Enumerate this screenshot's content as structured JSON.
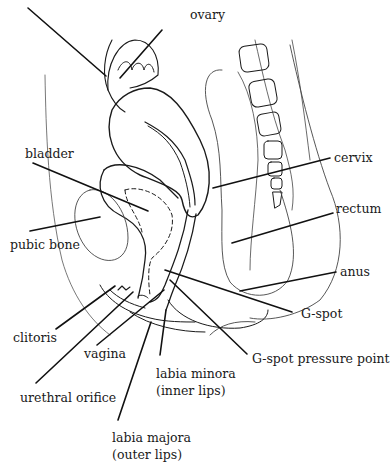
{
  "diagram": {
    "title": "",
    "colors": {
      "ink": "#1a1a1a",
      "thin": "#444444",
      "background": "#ffffff"
    },
    "labels": {
      "ovary": "ovary",
      "bladder": "bladder",
      "pubic_bone": "pubic bone",
      "cervix": "cervix",
      "rectum": "rectum",
      "anus": "anus",
      "g_spot": "G-spot",
      "clitoris": "clitoris",
      "vagina": "vagina",
      "g_spot_pressure_point": "G-spot pressure point",
      "labia_minora_line1": "labia minora",
      "labia_minora_line2": "(inner lips)",
      "urethral_orifice": "urethral orifice",
      "labia_majora_line1": "labia majora",
      "labia_majora_line2": "(outer lips)"
    }
  }
}
